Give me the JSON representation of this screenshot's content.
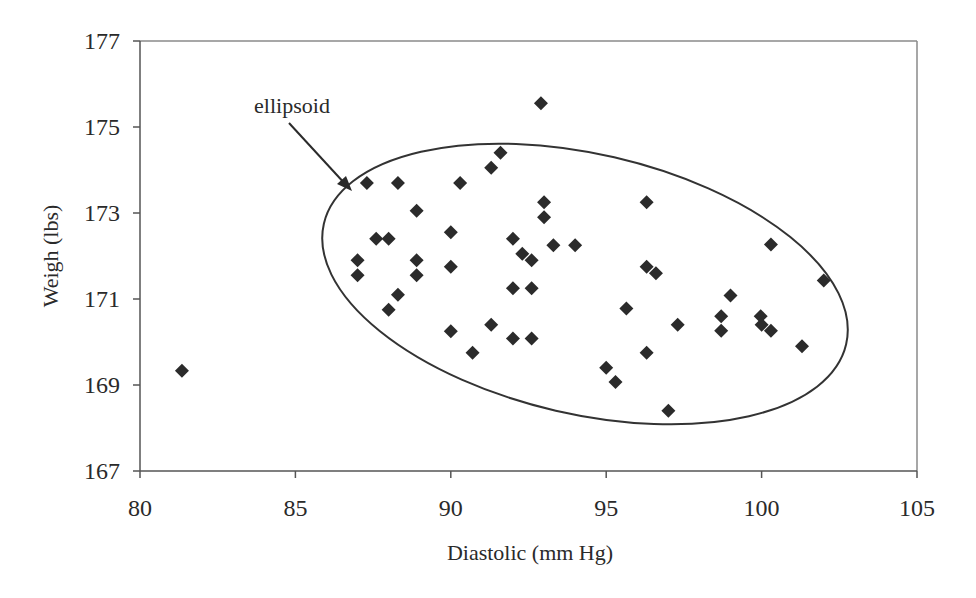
{
  "chart_data": {
    "type": "scatter",
    "title": "",
    "xlabel": "Diastolic (mm Hg)",
    "ylabel": "Weigh (lbs)",
    "xlim": [
      80,
      105
    ],
    "ylim": [
      167,
      177
    ],
    "xticks": [
      80,
      85,
      90,
      95,
      100,
      105
    ],
    "yticks": [
      167,
      169,
      171,
      173,
      175,
      177
    ],
    "grid": false,
    "legend": null,
    "marker": "diamond",
    "marker_color": "#2b2b2b",
    "annotations": [
      {
        "text": "ellipsoid",
        "type": "arrow-label",
        "points_to": "ellipse boundary near (87, 173.8)"
      }
    ],
    "shapes": [
      {
        "type": "ellipse",
        "description": "tilted confidence ellipse enclosing the main cluster",
        "x_range": [
          86.0,
          103.1
        ],
        "y_range": [
          168.2,
          174.6
        ]
      }
    ],
    "series": [
      {
        "name": "Diastolic vs Weight",
        "points": [
          [
            81.35,
            169.33
          ],
          [
            87.0,
            171.9
          ],
          [
            87.0,
            171.55
          ],
          [
            87.3,
            173.7
          ],
          [
            87.6,
            172.4
          ],
          [
            88.0,
            172.4
          ],
          [
            88.0,
            170.75
          ],
          [
            88.3,
            173.7
          ],
          [
            88.3,
            171.1
          ],
          [
            88.9,
            173.05
          ],
          [
            88.9,
            171.9
          ],
          [
            88.9,
            171.55
          ],
          [
            90.0,
            172.55
          ],
          [
            90.0,
            171.75
          ],
          [
            90.0,
            170.25
          ],
          [
            90.3,
            173.7
          ],
          [
            90.7,
            169.75
          ],
          [
            91.3,
            174.05
          ],
          [
            91.3,
            170.4
          ],
          [
            91.6,
            174.4
          ],
          [
            92.0,
            172.4
          ],
          [
            92.0,
            171.25
          ],
          [
            92.0,
            170.08
          ],
          [
            92.3,
            172.05
          ],
          [
            92.6,
            171.9
          ],
          [
            92.6,
            171.25
          ],
          [
            92.6,
            170.08
          ],
          [
            92.9,
            175.55
          ],
          [
            93.0,
            173.25
          ],
          [
            93.0,
            172.9
          ],
          [
            93.3,
            172.25
          ],
          [
            94.0,
            172.25
          ],
          [
            95.0,
            169.4
          ],
          [
            95.3,
            169.07
          ],
          [
            95.65,
            170.78
          ],
          [
            96.3,
            173.25
          ],
          [
            96.3,
            171.75
          ],
          [
            96.3,
            169.75
          ],
          [
            96.6,
            171.6
          ],
          [
            97.0,
            168.4
          ],
          [
            97.3,
            170.4
          ],
          [
            98.7,
            170.6
          ],
          [
            98.7,
            170.26
          ],
          [
            99.0,
            171.08
          ],
          [
            99.97,
            170.6
          ],
          [
            100.0,
            170.4
          ],
          [
            100.3,
            172.27
          ],
          [
            100.3,
            170.26
          ],
          [
            101.3,
            169.9
          ],
          [
            102.0,
            171.43
          ]
        ]
      }
    ]
  },
  "labels": {
    "xlabel": "Diastolic (mm Hg)",
    "ylabel": "Weigh (lbs)",
    "annotation": "ellipsoid",
    "xticks": [
      "80",
      "85",
      "90",
      "95",
      "100",
      "105"
    ],
    "yticks": [
      "167",
      "169",
      "171",
      "173",
      "175",
      "177"
    ]
  }
}
